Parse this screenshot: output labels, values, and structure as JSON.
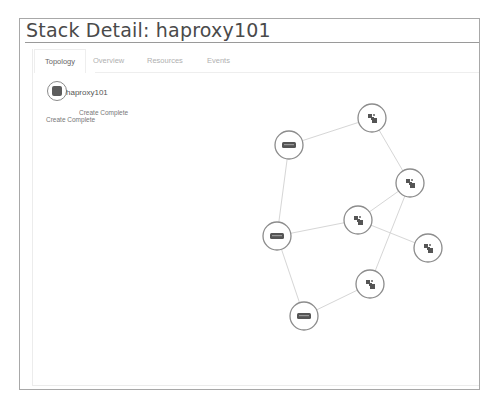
{
  "page": {
    "title": "Stack Detail: haproxy101"
  },
  "tabs": [
    {
      "label": "Topology",
      "active": true
    },
    {
      "label": "Overview",
      "active": false
    },
    {
      "label": "Resources",
      "active": false
    },
    {
      "label": "Events",
      "active": false
    }
  ],
  "stack": {
    "name": "haproxy101",
    "status_line_1": "Create Complete",
    "status_line_2": "Create Complete",
    "icon": "stack-icon"
  },
  "topology": {
    "colors": {
      "edge": "#d6d6d6",
      "node_border": "#8c8c8c",
      "icon": "#555555"
    },
    "nodes": [
      {
        "id": "net1",
        "type": "network",
        "icon": "network-icon"
      },
      {
        "id": "srv1",
        "type": "server",
        "icon": "server-icon"
      },
      {
        "id": "net2",
        "type": "network",
        "icon": "network-icon"
      },
      {
        "id": "net3",
        "type": "network",
        "icon": "network-icon"
      },
      {
        "id": "srv2",
        "type": "server",
        "icon": "server-icon"
      },
      {
        "id": "net4",
        "type": "network",
        "icon": "network-icon"
      },
      {
        "id": "net5",
        "type": "network",
        "icon": "network-icon"
      },
      {
        "id": "srv3",
        "type": "server",
        "icon": "server-icon"
      }
    ],
    "edges": [
      [
        "srv1",
        "net1"
      ],
      [
        "net1",
        "net2"
      ],
      [
        "srv1",
        "srv2"
      ],
      [
        "net2",
        "net3"
      ],
      [
        "net2",
        "net5"
      ],
      [
        "srv2",
        "net3"
      ],
      [
        "net3",
        "net4"
      ],
      [
        "srv2",
        "srv3"
      ],
      [
        "srv3",
        "net5"
      ]
    ]
  }
}
